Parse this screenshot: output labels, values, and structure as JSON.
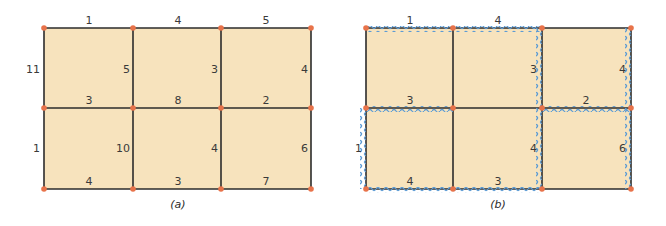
{
  "colors": {
    "cell_fill": "#f7e3bd",
    "edge": "#2b2b2b",
    "node": "#e8734a",
    "wavy": "#5b9bd5"
  },
  "panel_a": {
    "caption": "(a)",
    "top": [
      "1",
      "4",
      "5"
    ],
    "row1_vertical": [
      "11",
      "5",
      "3",
      "4"
    ],
    "middle": [
      "3",
      "8",
      "2"
    ],
    "row2_vertical": [
      "1",
      "10",
      "4",
      "6"
    ],
    "bottom": [
      "4",
      "3",
      "7"
    ]
  },
  "panel_b": {
    "caption": "(b)",
    "top": [
      "1",
      "4",
      ""
    ],
    "row1_vertical": [
      "",
      "",
      "3",
      "4"
    ],
    "middle": [
      "3",
      "",
      "2"
    ],
    "row2_vertical": [
      "1",
      "",
      "4",
      "6"
    ],
    "bottom": [
      "4",
      "3",
      ""
    ]
  }
}
